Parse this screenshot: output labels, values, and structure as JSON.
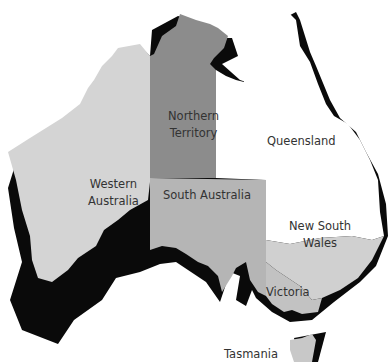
{
  "map": {
    "title": "Australia",
    "colors": {
      "western_australia": "#d4d4d4",
      "northern_territory": "#8c8c8c",
      "south_australia": "#b5b5b5",
      "queensland": "#ffffff",
      "new_south_wales": "#d0d0d0",
      "victoria": "#c2c2c2",
      "tasmania": "#c8c8c8",
      "shadow": "#0a0a0a"
    },
    "states": [
      {
        "id": "western-australia",
        "label_line1": "Western",
        "label_line2": "Australia"
      },
      {
        "id": "northern-territory",
        "label_line1": "Northern",
        "label_line2": "Territory"
      },
      {
        "id": "queensland",
        "label_line1": "Queensland"
      },
      {
        "id": "south-australia",
        "label_line1": "South Australia"
      },
      {
        "id": "new-south-wales",
        "label_line1": "New South",
        "label_line2": "Wales"
      },
      {
        "id": "victoria",
        "label_line1": "Victoria"
      },
      {
        "id": "tasmania",
        "label_line1": "Tasmania"
      }
    ]
  }
}
